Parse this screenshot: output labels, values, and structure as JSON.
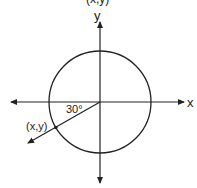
{
  "diagram": {
    "type": "unit-circle",
    "axes": {
      "x_label": "x",
      "y_label": "y"
    },
    "top_partial_label": "(x,y)",
    "angle_label": "30°",
    "point_label": "(x,y)",
    "angle_degrees": 30,
    "colors": {
      "stroke": "#222222",
      "background": "#ffffff"
    }
  }
}
